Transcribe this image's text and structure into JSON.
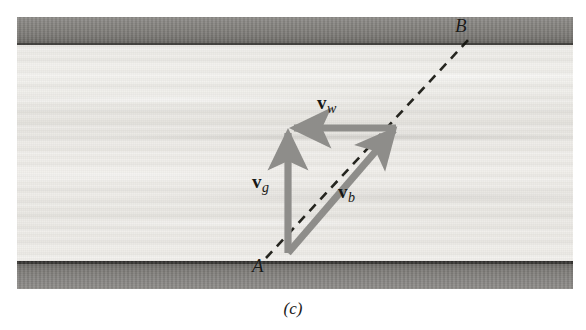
{
  "figure": {
    "caption": "(c)",
    "kind": "relative-velocity-river-crossing-diagram",
    "scene": {
      "description": "river with two banks and water between",
      "water_color": "#eceae6",
      "bank_color": "#807e7a",
      "bank_edge_color": "#333230"
    },
    "points": [
      {
        "id": "A",
        "label": "A",
        "x": 266,
        "y": 275,
        "note": "start point on near bank"
      },
      {
        "id": "B",
        "label": "B",
        "x": 462,
        "y": 30,
        "note": "end point on far bank"
      }
    ],
    "path": {
      "name": "intended-path",
      "style": "dashed",
      "color": "#15150f",
      "from": "A",
      "to": "B",
      "x1": 266,
      "y1": 258,
      "x2": 470,
      "y2": 38
    },
    "vectors": [
      {
        "id": "vg",
        "symbol": "v",
        "subscript": "g",
        "label_x": 269,
        "label_y": 181,
        "direction": "up",
        "color": "#8e8d8a",
        "tail_x": 288,
        "tail_y": 253,
        "tip_x": 288,
        "tip_y": 129,
        "meaning": "velocity of boat relative to ground"
      },
      {
        "id": "vw",
        "symbol": "v",
        "subscript": "w",
        "label_x": 334,
        "label_y": 102,
        "direction": "left",
        "color": "#8e8d8a",
        "tail_x": 396,
        "tail_y": 128,
        "tip_x": 288,
        "tip_y": 128,
        "meaning": "velocity of water relative to ground"
      },
      {
        "id": "vb",
        "symbol": "v",
        "subscript": "b",
        "label_x": 355,
        "label_y": 191,
        "direction": "up-right",
        "color": "#8e8d8a",
        "tail_x": 288,
        "tail_y": 253,
        "tip_x": 396,
        "tip_y": 128,
        "meaning": "velocity of boat relative to water"
      }
    ]
  }
}
